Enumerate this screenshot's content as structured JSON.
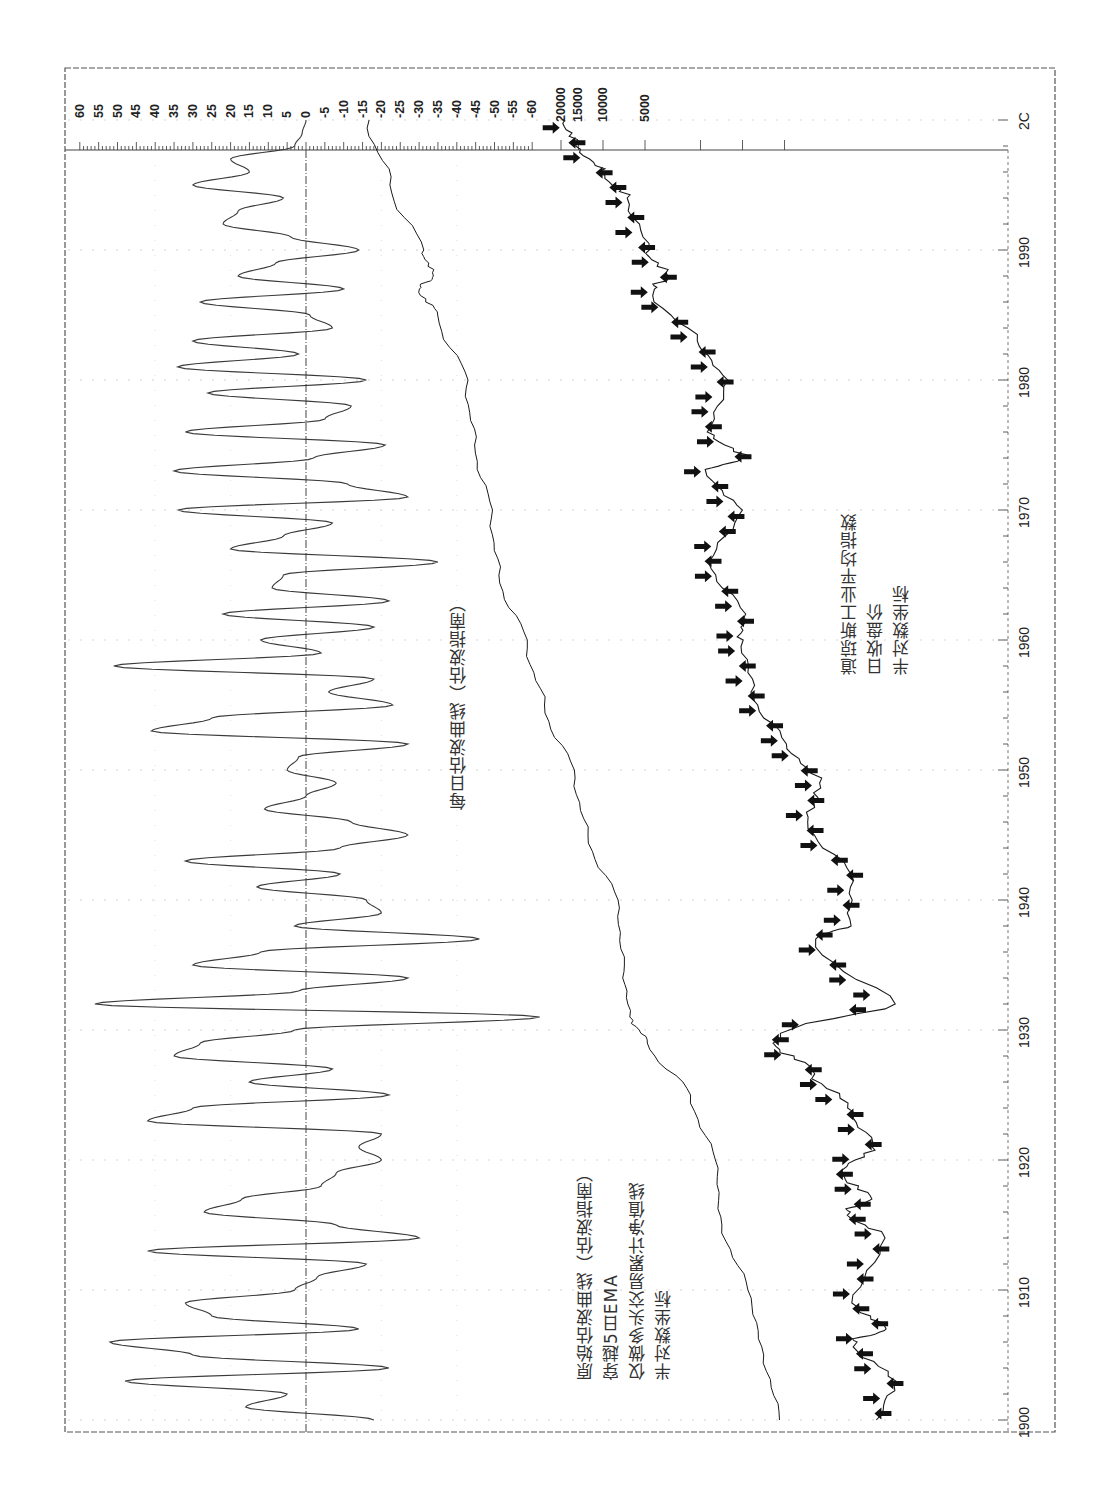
{
  "chart_data": {
    "type": "line",
    "orientation": "rotated-90-clockwise",
    "title": "",
    "x_axis": {
      "label": "Year",
      "ticks": [
        "1900",
        "1910",
        "1920",
        "1930",
        "1940",
        "1950",
        "1960",
        "1970",
        "1980",
        "1990",
        "2C"
      ],
      "range": [
        1899,
        2000
      ]
    },
    "oscillator_axis": {
      "ticks": [
        60,
        55,
        50,
        45,
        40,
        35,
        30,
        25,
        20,
        15,
        10,
        5,
        0,
        -5,
        -10,
        -15,
        -20,
        -25,
        -30,
        -35,
        -40,
        -45,
        -50,
        -55,
        -60
      ],
      "range": [
        -60,
        60
      ],
      "zero_line": true
    },
    "price_axis": {
      "scale": "log",
      "ticks": [
        20000,
        15000,
        10000,
        5000
      ]
    },
    "series": [
      {
        "name": "每日估波曲线（估波指南）",
        "kind": "oscillator",
        "points": [
          [
            1900,
            -18
          ],
          [
            1901,
            16
          ],
          [
            1902,
            5
          ],
          [
            1903,
            48
          ],
          [
            1904,
            -22
          ],
          [
            1905,
            30
          ],
          [
            1906,
            52
          ],
          [
            1907,
            -14
          ],
          [
            1908,
            25
          ],
          [
            1909,
            32
          ],
          [
            1910,
            3
          ],
          [
            1911,
            -3
          ],
          [
            1912,
            -16
          ],
          [
            1913,
            42
          ],
          [
            1914,
            -30
          ],
          [
            1915,
            -8
          ],
          [
            1916,
            27
          ],
          [
            1917,
            17
          ],
          [
            1918,
            -4
          ],
          [
            1919,
            -8
          ],
          [
            1920,
            -20
          ],
          [
            1921,
            -14
          ],
          [
            1922,
            -20
          ],
          [
            1923,
            42
          ],
          [
            1924,
            30
          ],
          [
            1925,
            -22
          ],
          [
            1926,
            15
          ],
          [
            1927,
            -7
          ],
          [
            1928,
            35
          ],
          [
            1929,
            28
          ],
          [
            1930,
            3
          ],
          [
            1931,
            -62
          ],
          [
            1932,
            56
          ],
          [
            1933,
            2
          ],
          [
            1934,
            -27
          ],
          [
            1935,
            30
          ],
          [
            1936,
            12
          ],
          [
            1937,
            -46
          ],
          [
            1938,
            3
          ],
          [
            1939,
            -20
          ],
          [
            1940,
            -16
          ],
          [
            1941,
            13
          ],
          [
            1942,
            -9
          ],
          [
            1943,
            32
          ],
          [
            1944,
            -9
          ],
          [
            1945,
            -27
          ],
          [
            1946,
            -12
          ],
          [
            1947,
            11
          ],
          [
            1948,
            0
          ],
          [
            1949,
            -8
          ],
          [
            1950,
            5
          ],
          [
            1951,
            2
          ],
          [
            1952,
            -27
          ],
          [
            1953,
            41
          ],
          [
            1954,
            25
          ],
          [
            1955,
            -23
          ],
          [
            1956,
            -6
          ],
          [
            1957,
            -18
          ],
          [
            1958,
            51
          ],
          [
            1959,
            -4
          ],
          [
            1960,
            12
          ],
          [
            1961,
            -18
          ],
          [
            1962,
            22
          ],
          [
            1963,
            -22
          ],
          [
            1964,
            9
          ],
          [
            1965,
            6
          ],
          [
            1966,
            -35
          ],
          [
            1967,
            20
          ],
          [
            1968,
            6
          ],
          [
            1969,
            -7
          ],
          [
            1970,
            34
          ],
          [
            1971,
            -27
          ],
          [
            1972,
            -11
          ],
          [
            1973,
            35
          ],
          [
            1974,
            -2
          ],
          [
            1975,
            -21
          ],
          [
            1976,
            32
          ],
          [
            1977,
            -5
          ],
          [
            1978,
            -12
          ],
          [
            1979,
            26
          ],
          [
            1980,
            -16
          ],
          [
            1981,
            34
          ],
          [
            1982,
            2
          ],
          [
            1983,
            30
          ],
          [
            1984,
            -7
          ],
          [
            1985,
            -1
          ],
          [
            1986,
            28
          ],
          [
            1987,
            -10
          ],
          [
            1988,
            18
          ],
          [
            1989,
            8
          ],
          [
            1990,
            -14
          ],
          [
            1991,
            4
          ],
          [
            1992,
            22
          ],
          [
            1993,
            18
          ],
          [
            1994,
            6
          ],
          [
            1995,
            30
          ],
          [
            1996,
            15
          ],
          [
            1997,
            20
          ],
          [
            1998,
            3
          ],
          [
            1999,
            1
          ],
          [
            2000,
            0
          ]
        ]
      },
      {
        "name": "道琼斯工业平均指数 日收盘价 半对数坐标",
        "kind": "price",
        "signals": "arrow markers (buy/sell crossings)",
        "points": [
          [
            1900,
            62
          ],
          [
            1903,
            48
          ],
          [
            1906,
            95
          ],
          [
            1907,
            55
          ],
          [
            1909,
            95
          ],
          [
            1914,
            55
          ],
          [
            1916,
            105
          ],
          [
            1917,
            70
          ],
          [
            1919,
            115
          ],
          [
            1921,
            68
          ],
          [
            1924,
            100
          ],
          [
            1927,
            190
          ],
          [
            1929,
            350
          ],
          [
            1932,
            45
          ],
          [
            1937,
            180
          ],
          [
            1938,
            105
          ],
          [
            1942,
            95
          ],
          [
            1946,
            200
          ],
          [
            1949,
            165
          ],
          [
            1952,
            280
          ],
          [
            1956,
            500
          ],
          [
            1960,
            620
          ],
          [
            1962,
            560
          ],
          [
            1966,
            990
          ],
          [
            1970,
            630
          ],
          [
            1973,
            1050
          ],
          [
            1974,
            580
          ],
          [
            1976,
            1000
          ],
          [
            1980,
            800
          ],
          [
            1983,
            1200
          ],
          [
            1987,
            2600
          ],
          [
            1988,
            2000
          ],
          [
            1990,
            2900
          ],
          [
            1994,
            3900
          ],
          [
            1996,
            6000
          ],
          [
            1998,
            9000
          ],
          [
            2000,
            11500
          ]
        ]
      },
      {
        "name": "原始估波曲线（估波指南） 穿越5日EMA 仅做多头交易累计净值线 半对数坐标",
        "kind": "equity",
        "points": [
          [
            1900,
            1
          ],
          [
            1905,
            1.3
          ],
          [
            1910,
            1.6
          ],
          [
            1915,
            2.4
          ],
          [
            1920,
            2.6
          ],
          [
            1925,
            3.8
          ],
          [
            1929,
            7
          ],
          [
            1931,
            9
          ],
          [
            1935,
            10
          ],
          [
            1940,
            11
          ],
          [
            1945,
            17
          ],
          [
            1950,
            21
          ],
          [
            1955,
            32
          ],
          [
            1960,
            42
          ],
          [
            1965,
            62
          ],
          [
            1970,
            70
          ],
          [
            1975,
            88
          ],
          [
            1980,
            100
          ],
          [
            1985,
            150
          ],
          [
            1987,
            200
          ],
          [
            1988,
            160
          ],
          [
            1990,
            190
          ],
          [
            1995,
            300
          ],
          [
            2000,
            420
          ]
        ]
      }
    ],
    "annotations": [
      "每日估波曲线（估波指南）",
      "道琼斯工业平均指数",
      "日收盘价",
      "半对数坐标",
      "原始估波曲线（估波指南）",
      "穿越5日EMA",
      "仅做多头交易累计净值线",
      "半对数坐标"
    ]
  },
  "labels": {
    "osc_title": "每日估波曲线（估波指南）",
    "dow": {
      "line1": "道琼斯工业平均指数",
      "line2": "日收盘价",
      "line3": "半对数坐标"
    },
    "equity": {
      "line1": "原始估波曲线（估波指南）",
      "line2": "穿越5日EMA",
      "line3": "仅做多头交易累计净值线",
      "line4": "半对数坐标"
    }
  },
  "colors": {
    "line": "#3a3a3a",
    "price": "#1a1a1a",
    "grid": "#9a9a9a",
    "arrow": "#111111"
  }
}
